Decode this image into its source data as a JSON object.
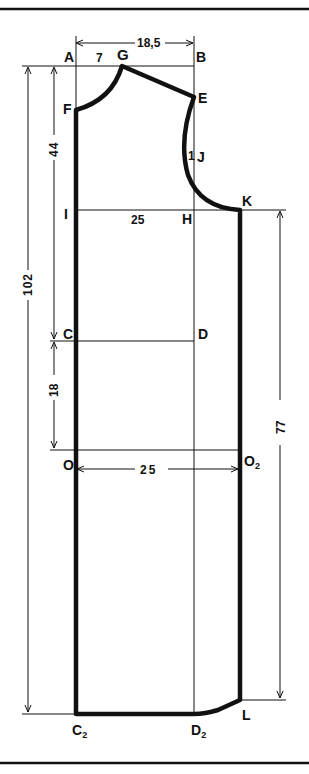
{
  "diagram": {
    "points": {
      "A": "A",
      "B": "B",
      "G": "G",
      "E": "E",
      "F": "F",
      "J": "J",
      "K": "K",
      "I": "I",
      "H": "H",
      "C": "C",
      "D": "D",
      "O": "O",
      "O2": "O",
      "O2_sub": "2",
      "C2": "C",
      "C2_sub": "2",
      "D2": "D",
      "D2_sub": "2",
      "L": "L"
    },
    "dimensions": {
      "top_width": "18,5",
      "neck_width": "7",
      "chest_width": "25",
      "hip_width": "25",
      "armhole_offset": "1",
      "total_length": "102",
      "upper_length": "44",
      "waist_to_hip": "18",
      "side_length": "77"
    },
    "colors": {
      "line": "#111111",
      "background": "#ffffff"
    }
  }
}
